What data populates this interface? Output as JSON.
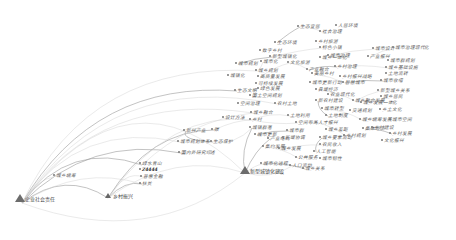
{
  "diagram": {
    "type": "keyword-cooccurrence-network",
    "colors": {
      "background": "#ffffff",
      "link": "#cfcfcf",
      "link_dark": "#9a9a9a",
      "node": "#6c6c6c",
      "label": "#5a5a5a"
    },
    "hubs": [
      {
        "id": "h1",
        "label": "企业社会责任",
        "x": 20,
        "y": 200,
        "size": "large"
      },
      {
        "id": "h2",
        "label": "乡村振兴",
        "x": 108,
        "y": 197,
        "size": "small"
      },
      {
        "id": "h3",
        "label": "新型城镇化建设",
        "x": 245,
        "y": 172,
        "size": "large"
      }
    ],
    "nodes": [
      {
        "label": "城乡统筹",
        "x": 56,
        "y": 175
      },
      {
        "label": "绿水青山",
        "x": 142,
        "y": 163
      },
      {
        "label": "Z4444",
        "x": 142,
        "y": 169,
        "bold": true
      },
      {
        "label": "普惠金融",
        "x": 143,
        "y": 176
      },
      {
        "label": "扶贫",
        "x": 142,
        "y": 183
      },
      {
        "label": "新兴产业",
        "x": 186,
        "y": 130
      },
      {
        "label": "城市规划体系",
        "x": 180,
        "y": 141
      },
      {
        "label": "生态保护",
        "x": 213,
        "y": 141
      },
      {
        "label": "国内外研究综述",
        "x": 181,
        "y": 152
      },
      {
        "label": "碳",
        "x": 214,
        "y": 129
      },
      {
        "label": "设计方法",
        "x": 225,
        "y": 117
      },
      {
        "label": "城乡融合",
        "x": 253,
        "y": 112
      },
      {
        "label": "乡村",
        "x": 252,
        "y": 119
      },
      {
        "label": "城镇群落",
        "x": 252,
        "y": 127
      },
      {
        "label": "城市更新",
        "x": 257,
        "y": 134
      },
      {
        "label": "农村土地",
        "x": 277,
        "y": 103
      },
      {
        "label": "产业结构",
        "x": 270,
        "y": 138
      },
      {
        "label": "集约发展",
        "x": 265,
        "y": 146
      },
      {
        "label": "城乡发展",
        "x": 281,
        "y": 148
      },
      {
        "label": "空间布局",
        "x": 298,
        "y": 122
      },
      {
        "label": "土地利用",
        "x": 290,
        "y": 115
      },
      {
        "label": "城市群",
        "x": 289,
        "y": 130
      },
      {
        "label": "区域协调",
        "x": 285,
        "y": 137
      },
      {
        "label": "公共服务",
        "x": 298,
        "y": 157
      },
      {
        "label": "城市化进程",
        "x": 263,
        "y": 163
      },
      {
        "label": "人口流动",
        "x": 292,
        "y": 165
      },
      {
        "label": "绿色发展",
        "x": 260,
        "y": 88
      },
      {
        "label": "国土空间规划",
        "x": 252,
        "y": 95
      },
      {
        "label": "生态文明",
        "x": 237,
        "y": 90
      },
      {
        "label": "空间治理",
        "x": 240,
        "y": 103
      },
      {
        "label": "可持续发展",
        "x": 258,
        "y": 83
      },
      {
        "label": "高质量发展",
        "x": 260,
        "y": 76
      },
      {
        "label": "城乡规划",
        "x": 258,
        "y": 70
      },
      {
        "label": "城市规划",
        "x": 238,
        "y": 63
      },
      {
        "label": "数字乡村",
        "x": 262,
        "y": 50
      },
      {
        "label": "生态环境",
        "x": 277,
        "y": 42
      },
      {
        "label": "新型城镇化",
        "x": 272,
        "y": 56
      },
      {
        "label": "城市化",
        "x": 263,
        "y": 61
      },
      {
        "label": "城镇化",
        "x": 230,
        "y": 75
      },
      {
        "label": "文化旅游",
        "x": 290,
        "y": 62
      },
      {
        "label": "产业融合",
        "x": 309,
        "y": 69
      },
      {
        "label": "城市治理",
        "x": 330,
        "y": 55
      },
      {
        "label": "社会治理",
        "x": 322,
        "y": 31
      },
      {
        "label": "人居环境",
        "x": 338,
        "y": 25
      },
      {
        "label": "生态宜居",
        "x": 300,
        "y": 26
      },
      {
        "label": "乡村旅游",
        "x": 318,
        "y": 41
      },
      {
        "label": "特色小镇",
        "x": 322,
        "y": 47
      },
      {
        "label": "城乡一体化",
        "x": 322,
        "y": 57
      },
      {
        "label": "乡村治理",
        "x": 337,
        "y": 66
      },
      {
        "label": "美丽乡村",
        "x": 314,
        "y": 73
      },
      {
        "label": "城市更新行动",
        "x": 312,
        "y": 82
      },
      {
        "label": "县域经济",
        "x": 318,
        "y": 89
      },
      {
        "label": "农业现代化",
        "x": 330,
        "y": 94
      },
      {
        "label": "新农村建设",
        "x": 318,
        "y": 100
      },
      {
        "label": "城市转型",
        "x": 324,
        "y": 108
      },
      {
        "label": "土地制度",
        "x": 328,
        "y": 115
      },
      {
        "label": "人才振兴",
        "x": 318,
        "y": 122
      },
      {
        "label": "城乡差距",
        "x": 328,
        "y": 129
      },
      {
        "label": "城乡要素流动",
        "x": 322,
        "y": 137
      },
      {
        "label": "农民收入",
        "x": 322,
        "y": 144
      },
      {
        "label": "人工智能",
        "x": 316,
        "y": 151
      },
      {
        "label": "城市韧性",
        "x": 322,
        "y": 158
      },
      {
        "label": "城乡关系",
        "x": 305,
        "y": 168
      },
      {
        "label": "乡村振兴战略",
        "x": 342,
        "y": 76
      },
      {
        "label": "智慧城市",
        "x": 345,
        "y": 82
      },
      {
        "label": "城乡融合发展",
        "x": 355,
        "y": 100
      },
      {
        "label": "交通规划",
        "x": 352,
        "y": 110
      },
      {
        "label": "城乡统筹发展",
        "x": 362,
        "y": 119
      },
      {
        "label": "集体经济",
        "x": 365,
        "y": 128
      },
      {
        "label": "乡村规划",
        "x": 346,
        "y": 135
      },
      {
        "label": "城市设计",
        "x": 375,
        "y": 48
      },
      {
        "label": "产业振兴",
        "x": 370,
        "y": 56
      },
      {
        "label": "城市治理现代化",
        "x": 395,
        "y": 47
      },
      {
        "label": "城市群规划",
        "x": 390,
        "y": 60
      },
      {
        "label": "城乡基础设施",
        "x": 388,
        "y": 67
      },
      {
        "label": "土地流转",
        "x": 388,
        "y": 73
      },
      {
        "label": "城市收缩",
        "x": 383,
        "y": 80
      },
      {
        "label": "新型城乡关系",
        "x": 380,
        "y": 90
      },
      {
        "label": "城乡居民",
        "x": 383,
        "y": 96
      },
      {
        "label": "城乡发展一体化",
        "x": 363,
        "y": 102
      },
      {
        "label": "乡土文化",
        "x": 382,
        "y": 109
      },
      {
        "label": "城市空间",
        "x": 392,
        "y": 119
      },
      {
        "label": "乡村建设",
        "x": 374,
        "y": 127
      },
      {
        "label": "乡村发展",
        "x": 392,
        "y": 133
      },
      {
        "label": "文化振兴",
        "x": 384,
        "y": 140
      }
    ],
    "links": [
      {
        "from": [
          22,
          203
        ],
        "to": [
          108,
          198
        ],
        "cx": 65,
        "cy": 170
      },
      {
        "from": [
          22,
          203
        ],
        "to": [
          245,
          173
        ],
        "cx": 130,
        "cy": 60
      },
      {
        "from": [
          22,
          203
        ],
        "to": [
          245,
          173
        ],
        "cx": 150,
        "cy": 250
      },
      {
        "from": [
          22,
          203
        ],
        "to": [
          142,
          165
        ],
        "cx": 70,
        "cy": 140
      },
      {
        "from": [
          22,
          203
        ],
        "to": [
          142,
          184
        ],
        "cx": 80,
        "cy": 165
      },
      {
        "from": [
          22,
          203
        ],
        "to": [
          180,
          142
        ],
        "cx": 80,
        "cy": 120
      },
      {
        "from": [
          22,
          203
        ],
        "to": [
          181,
          153
        ],
        "cx": 90,
        "cy": 135
      },
      {
        "from": [
          22,
          203
        ],
        "to": [
          253,
          113
        ],
        "cx": 100,
        "cy": 90
      },
      {
        "from": [
          22,
          203
        ],
        "to": [
          258,
          71
        ],
        "cx": 90,
        "cy": 60
      },
      {
        "from": [
          22,
          203
        ],
        "to": [
          237,
          91
        ],
        "cx": 95,
        "cy": 80
      },
      {
        "from": [
          22,
          203
        ],
        "to": [
          277,
          104
        ],
        "cx": 110,
        "cy": 70
      },
      {
        "from": [
          22,
          203
        ],
        "to": [
          56,
          176
        ],
        "cx": 35,
        "cy": 180
      },
      {
        "from": [
          108,
          198
        ],
        "to": [
          142,
          184
        ],
        "cx": 125,
        "cy": 180
      },
      {
        "from": [
          108,
          198
        ],
        "to": [
          143,
          177
        ],
        "cx": 125,
        "cy": 170
      },
      {
        "from": [
          108,
          198
        ],
        "to": [
          245,
          173
        ],
        "cx": 175,
        "cy": 150
      },
      {
        "from": [
          108,
          198
        ],
        "to": [
          214,
          130
        ],
        "cx": 150,
        "cy": 130
      },
      {
        "from": [
          108,
          198
        ],
        "to": [
          252,
          120
        ],
        "cx": 170,
        "cy": 110
      },
      {
        "from": [
          142,
          165
        ],
        "to": [
          253,
          113
        ],
        "cx": 190,
        "cy": 120
      },
      {
        "from": [
          186,
          131
        ],
        "to": [
          213,
          142
        ],
        "cx": 180,
        "cy": 140
      },
      {
        "from": [
          214,
          130
        ],
        "to": [
          252,
          120
        ],
        "cx": 235,
        "cy": 120
      },
      {
        "from": [
          213,
          142
        ],
        "to": [
          252,
          128
        ],
        "cx": 235,
        "cy": 145
      },
      {
        "from": [
          245,
          173
        ],
        "to": [
          252,
          128
        ],
        "cx": 240,
        "cy": 150
      },
      {
        "from": [
          245,
          173
        ],
        "to": [
          263,
          164
        ],
        "cx": 255,
        "cy": 165
      },
      {
        "from": [
          245,
          173
        ],
        "to": [
          292,
          166
        ],
        "cx": 270,
        "cy": 180
      },
      {
        "from": [
          245,
          173
        ],
        "to": [
          270,
          139
        ],
        "cx": 255,
        "cy": 150
      },
      {
        "from": [
          252,
          120
        ],
        "to": [
          290,
          116
        ],
        "cx": 270,
        "cy": 112
      },
      {
        "from": [
          252,
          120
        ],
        "to": [
          298,
          123
        ],
        "cx": 275,
        "cy": 125
      },
      {
        "from": [
          257,
          135
        ],
        "to": [
          289,
          131
        ],
        "cx": 272,
        "cy": 130
      },
      {
        "from": [
          265,
          147
        ],
        "to": [
          298,
          158
        ],
        "cx": 282,
        "cy": 148
      },
      {
        "from": [
          258,
          71
        ],
        "to": [
          263,
          62
        ],
        "cx": 262,
        "cy": 66
      },
      {
        "from": [
          238,
          64
        ],
        "to": [
          272,
          57
        ],
        "cx": 255,
        "cy": 58
      },
      {
        "from": [
          260,
          77
        ],
        "to": [
          290,
          63
        ],
        "cx": 276,
        "cy": 66
      },
      {
        "from": [
          272,
          57
        ],
        "to": [
          322,
          48
        ],
        "cx": 300,
        "cy": 50
      },
      {
        "from": [
          277,
          43
        ],
        "to": [
          300,
          27
        ],
        "cx": 290,
        "cy": 32
      },
      {
        "from": [
          300,
          27
        ],
        "to": [
          322,
          32
        ],
        "cx": 310,
        "cy": 26
      },
      {
        "from": [
          290,
          63
        ],
        "to": [
          309,
          70
        ],
        "cx": 300,
        "cy": 64
      },
      {
        "from": [
          309,
          70
        ],
        "to": [
          337,
          67
        ],
        "cx": 322,
        "cy": 65
      },
      {
        "from": [
          314,
          74
        ],
        "to": [
          345,
          83
        ],
        "cx": 330,
        "cy": 76
      },
      {
        "from": [
          318,
          90
        ],
        "to": [
          355,
          101
        ],
        "cx": 338,
        "cy": 92
      },
      {
        "from": [
          318,
          101
        ],
        "to": [
          328,
          116
        ],
        "cx": 318,
        "cy": 110
      },
      {
        "from": [
          324,
          109
        ],
        "to": [
          362,
          120
        ],
        "cx": 345,
        "cy": 110
      },
      {
        "from": [
          318,
          123
        ],
        "to": [
          346,
          136
        ],
        "cx": 332,
        "cy": 126
      },
      {
        "from": [
          322,
          138
        ],
        "to": [
          316,
          152
        ],
        "cx": 314,
        "cy": 144
      },
      {
        "from": [
          330,
          56
        ],
        "to": [
          375,
          49
        ],
        "cx": 352,
        "cy": 50
      },
      {
        "from": [
          337,
          67
        ],
        "to": [
          388,
          68
        ],
        "cx": 362,
        "cy": 64
      },
      {
        "from": [
          345,
          83
        ],
        "to": [
          383,
          81
        ],
        "cx": 365,
        "cy": 79
      },
      {
        "from": [
          355,
          101
        ],
        "to": [
          380,
          91
        ],
        "cx": 368,
        "cy": 94
      },
      {
        "from": [
          362,
          120
        ],
        "to": [
          392,
          120
        ],
        "cx": 377,
        "cy": 116
      },
      {
        "from": [
          365,
          129
        ],
        "to": [
          392,
          134
        ],
        "cx": 378,
        "cy": 128
      },
      {
        "from": [
          370,
          57
        ],
        "to": [
          395,
          48
        ],
        "cx": 382,
        "cy": 50
      },
      {
        "from": [
          280,
          150
        ],
        "to": [
          322,
          145
        ],
        "cx": 300,
        "cy": 144
      },
      {
        "from": [
          263,
          164
        ],
        "to": [
          305,
          169
        ],
        "cx": 285,
        "cy": 162
      }
    ]
  }
}
